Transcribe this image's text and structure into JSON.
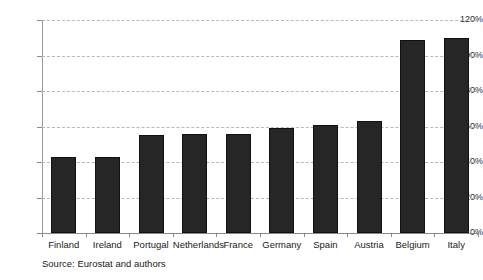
{
  "chart_data": {
    "type": "bar",
    "title": "",
    "subtitle": "",
    "xlabel": "",
    "ylabel": "",
    "categories": [
      "Finland",
      "Ireland",
      "Portugal",
      "Netherlands",
      "France",
      "Germany",
      "Spain",
      "Austria",
      "Belgium",
      "Italy"
    ],
    "values": [
      43,
      43,
      55,
      56,
      56,
      59,
      61,
      63,
      109,
      110
    ],
    "value_format": "percent",
    "ylim": [
      0,
      120
    ],
    "ytick_step": 20,
    "ytick_labels": [
      "0%",
      "20%",
      "40%",
      "60%",
      "80%",
      "100%",
      "120%"
    ],
    "ytick_values": [
      0,
      20,
      40,
      60,
      80,
      100,
      120
    ],
    "grid": "horizontal-dashed",
    "legend": "none",
    "series": [
      {
        "name": "",
        "values": [
          43,
          43,
          55,
          56,
          56,
          59,
          61,
          63,
          109,
          110
        ],
        "color": "#262626"
      }
    ]
  },
  "annotations": {
    "source_note": "Source: Eurostat and authors"
  },
  "colors": {
    "bar_fill": "#262626",
    "bar_border": "#111111",
    "gridline": "#b9b9b9",
    "axis_line": "#8a8a8a",
    "text": "#1a1a1a",
    "background": "#ffffff"
  }
}
